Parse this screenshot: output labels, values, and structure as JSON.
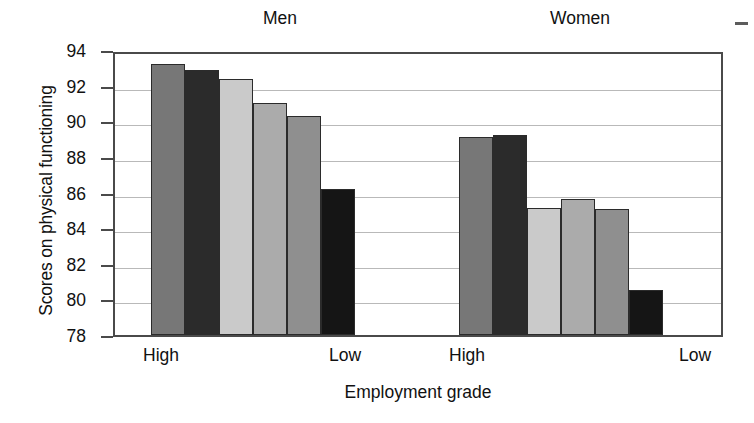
{
  "chart_data": {
    "type": "bar",
    "title": "",
    "xlabel": "Employment grade",
    "ylabel": "Scores on physical functioning",
    "ylim": [
      78,
      94
    ],
    "ytick_step": 2,
    "yticks": [
      94,
      92,
      90,
      88,
      86,
      84,
      82,
      80,
      78
    ],
    "grid": true,
    "legend": "none",
    "group_headers": [
      "Men",
      "Women"
    ],
    "categories": [
      "High",
      "Low",
      "High",
      "Low"
    ],
    "groups": [
      {
        "name": "Men",
        "axis_labels": [
          "High",
          "Low"
        ],
        "bars": [
          {
            "index": 1,
            "value": 93.2,
            "color": "#777777"
          },
          {
            "index": 2,
            "value": 92.9,
            "color": "#2b2b2b"
          },
          {
            "index": 3,
            "value": 92.4,
            "color": "#cacaca"
          },
          {
            "index": 4,
            "value": 91.0,
            "color": "#ababab"
          },
          {
            "index": 5,
            "value": 90.3,
            "color": "#8f8f8f"
          },
          {
            "index": 6,
            "value": 86.2,
            "color": "#151515"
          }
        ]
      },
      {
        "name": "Women",
        "axis_labels": [
          "High",
          "Low"
        ],
        "bars": [
          {
            "index": 1,
            "value": 89.1,
            "color": "#777777"
          },
          {
            "index": 2,
            "value": 89.25,
            "color": "#2b2b2b"
          },
          {
            "index": 3,
            "value": 85.15,
            "color": "#cacaca"
          },
          {
            "index": 4,
            "value": 85.65,
            "color": "#ababab"
          },
          {
            "index": 5,
            "value": 85.05,
            "color": "#8f8f8f"
          },
          {
            "index": 6,
            "value": 80.55,
            "color": "#151515"
          }
        ]
      }
    ]
  },
  "axis": {
    "y_title": "Scores on physical functioning",
    "x_title": "Employment grade"
  },
  "headers": {
    "men": "Men",
    "women": "Women"
  },
  "xlabels": {
    "men_high": "High",
    "men_low": "Low",
    "women_high": "High",
    "women_low": "Low"
  }
}
